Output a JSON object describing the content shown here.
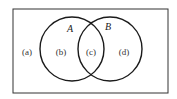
{
  "diagram": {
    "type": "venn",
    "universe": {
      "x": 13,
      "y": 9,
      "width": 155,
      "height": 84
    },
    "sets": [
      {
        "name": "A",
        "cx": 72,
        "cy": 49,
        "r": 32,
        "label_x": 70,
        "label_y": 32
      },
      {
        "name": "B",
        "cx": 110,
        "cy": 49,
        "r": 32,
        "label_x": 108,
        "label_y": 30
      }
    ],
    "regions": [
      {
        "label": "(a)",
        "x": 27,
        "y": 55
      },
      {
        "label": "(b)",
        "x": 61,
        "y": 55
      },
      {
        "label": "(c)",
        "x": 91,
        "y": 55
      },
      {
        "label": "(d)",
        "x": 124,
        "y": 55
      }
    ],
    "stroke_color": "#1a1a1a"
  }
}
